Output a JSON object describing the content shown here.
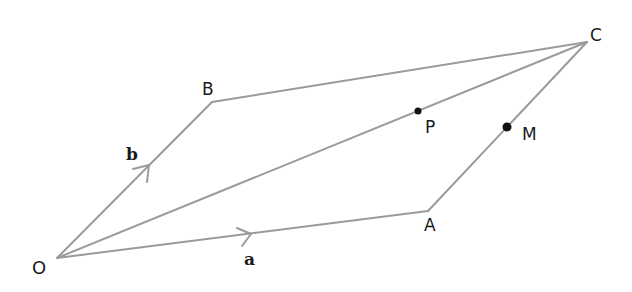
{
  "diagram": {
    "type": "parallelogram-vectors",
    "colors": {
      "line": "#9a9a9a",
      "point": "#111111",
      "text": "#1a1a1a"
    },
    "points": {
      "O": {
        "label": "O",
        "x": 57,
        "y": 258
      },
      "A": {
        "label": "A",
        "x": 428,
        "y": 211
      },
      "B": {
        "label": "B",
        "x": 212,
        "y": 102
      },
      "C": {
        "label": "C",
        "x": 587,
        "y": 42
      },
      "P": {
        "label": "P",
        "x": 418,
        "y": 111
      },
      "M": {
        "label": "M",
        "x": 507,
        "y": 127
      }
    },
    "vectors": {
      "a": {
        "label": "a",
        "from": "O",
        "to": "A"
      },
      "b": {
        "label": "b",
        "from": "O",
        "to": "B"
      }
    },
    "segments": [
      "OA",
      "OB",
      "BC",
      "AC",
      "OC"
    ]
  }
}
